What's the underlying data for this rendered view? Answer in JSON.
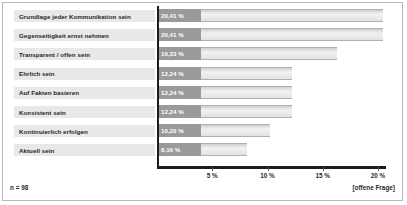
{
  "chart_data": {
    "type": "bar",
    "orientation": "horizontal",
    "title": "",
    "xlabel": "",
    "ylabel": "",
    "categories": [
      "Grundlage jeder Kommunikation sein",
      "Gegenseitigkeit ernst nehmen",
      "Transparent / offen sein",
      "Ehrlich sein",
      "Auf Fakten basieren",
      "Konsistent sein",
      "Kontinuierlich erfolgen",
      "Aktuell sein"
    ],
    "values": [
      20.41,
      20.41,
      16.33,
      12.24,
      12.24,
      12.24,
      10.2,
      8.16
    ],
    "value_labels": [
      "20,41 %",
      "20,41 %",
      "16,33 %",
      "12,24 %",
      "12,24 %",
      "12,24 %",
      "10,20 %",
      "8,16 %"
    ],
    "xlim": [
      0,
      21
    ],
    "xticks": [
      5,
      10,
      15,
      20
    ],
    "xtick_labels": [
      "5 %",
      "10 %",
      "15 %",
      "20 %"
    ],
    "grid": false,
    "legend": null,
    "colors": {
      "value_chip": "#9a9a9a",
      "bar": "#e2e2e2",
      "category_chip": "#e8e8e8",
      "axis": "#1c1c1c"
    }
  },
  "footer": {
    "sample_size": "n = 98",
    "question_type": "[offene Frage]"
  }
}
